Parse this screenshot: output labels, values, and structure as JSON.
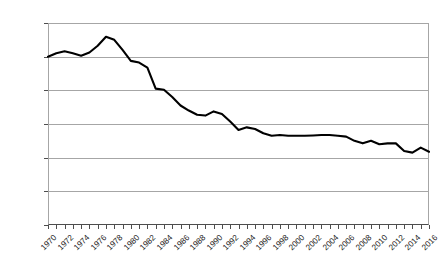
{
  "chart_data": {
    "type": "line",
    "title": "",
    "xlabel": "",
    "ylabel": "Index (1970 = 100)",
    "ylim": [
      0,
      120
    ],
    "ytick_values": [
      0,
      20,
      40,
      60,
      80,
      100,
      120
    ],
    "ytick_labels": [
      "0",
      "20",
      "40",
      "60",
      "80",
      "100",
      "120"
    ],
    "grid": true,
    "legend": "none",
    "xlim": [
      1970,
      2016
    ],
    "xtick_step": 1,
    "xtick_label_step": 2,
    "xtick_labels": [
      "1970",
      "1972",
      "1974",
      "1976",
      "1978",
      "1980",
      "1982",
      "1984",
      "1986",
      "1988",
      "1990",
      "1992",
      "1994",
      "1996",
      "1998",
      "2000",
      "2002",
      "2004",
      "2006",
      "2008",
      "2010",
      "2012",
      "2014",
      "2016"
    ],
    "series": [
      {
        "name": "Index",
        "color": "#000000",
        "line_width": 2.1,
        "x": [
          1970,
          1971,
          1972,
          1973,
          1974,
          1975,
          1976,
          1977,
          1978,
          1979,
          1980,
          1981,
          1982,
          1983,
          1984,
          1985,
          1986,
          1987,
          1988,
          1989,
          1990,
          1991,
          1992,
          1993,
          1994,
          1995,
          1996,
          1997,
          1998,
          1999,
          2000,
          2001,
          2002,
          2003,
          2004,
          2005,
          2006,
          2007,
          2008,
          2009,
          2010,
          2011,
          2012,
          2013,
          2014,
          2015,
          2016
        ],
        "values": [
          100.0,
          102.0,
          103.2,
          102.0,
          100.6,
          102.5,
          106.5,
          111.8,
          110.0,
          104.0,
          97.5,
          96.5,
          93.5,
          81.0,
          80.3,
          76.0,
          71.0,
          68.0,
          65.5,
          65.0,
          67.5,
          66.0,
          61.5,
          56.5,
          58.0,
          57.0,
          54.5,
          53.0,
          53.5,
          53.0,
          53.0,
          53.0,
          53.2,
          53.5,
          53.5,
          53.0,
          52.5,
          50.0,
          48.5,
          50.0,
          48.0,
          48.5,
          48.5,
          44.0,
          43.0,
          46.0,
          43.5
        ]
      }
    ]
  }
}
